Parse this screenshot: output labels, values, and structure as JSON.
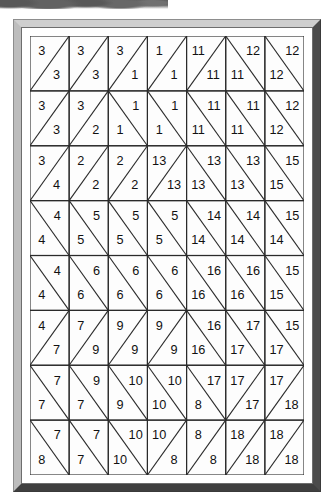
{
  "figure": {
    "kind": "triangulated-grid-label-diagram",
    "rows": 8,
    "cols": 7,
    "frame_color": "#d9d9d9",
    "line_color": "#2b2b2b",
    "label_color": "#111111",
    "background_color": "#ffffff",
    "artifact": {
      "name": "scan-smudge",
      "color": "#4f4f4f"
    }
  },
  "chart_data": {
    "type": "heatmap",
    "title": "",
    "xlabel": "",
    "ylabel": "",
    "rows": 8,
    "cols": 7,
    "note": "Each grid cell is split by a diagonal into two triangles; each triangle carries an integer region label.",
    "diagonal_legend": {
      "slash": "diagonal from bottom-left to top-right; upper triangle is upper-left, lower triangle is lower-right",
      "backslash": "diagonal from top-left to bottom-right; upper triangle is upper-right, lower triangle is lower-left"
    },
    "cells": [
      [
        {
          "diag": "slash",
          "upper": "3",
          "lower": "3"
        },
        {
          "diag": "slash",
          "upper": "3",
          "lower": "3"
        },
        {
          "diag": "slash",
          "upper": "3",
          "lower": "1"
        },
        {
          "diag": "slash",
          "upper": "1",
          "lower": "1"
        },
        {
          "diag": "slash",
          "upper": "11",
          "lower": "11"
        },
        {
          "diag": "backslash",
          "upper": "12",
          "lower": "11"
        },
        {
          "diag": "backslash",
          "upper": "12",
          "lower": "12"
        }
      ],
      [
        {
          "diag": "slash",
          "upper": "3",
          "lower": "3"
        },
        {
          "diag": "slash",
          "upper": "3",
          "lower": "2"
        },
        {
          "diag": "backslash",
          "upper": "1",
          "lower": "1"
        },
        {
          "diag": "backslash",
          "upper": "1",
          "lower": "1"
        },
        {
          "diag": "backslash",
          "upper": "11",
          "lower": "11"
        },
        {
          "diag": "backslash",
          "upper": "11",
          "lower": "11"
        },
        {
          "diag": "backslash",
          "upper": "12",
          "lower": "12"
        }
      ],
      [
        {
          "diag": "slash",
          "upper": "3",
          "lower": "4"
        },
        {
          "diag": "slash",
          "upper": "2",
          "lower": "2"
        },
        {
          "diag": "slash",
          "upper": "2",
          "lower": "2"
        },
        {
          "diag": "slash",
          "upper": "13",
          "lower": "13"
        },
        {
          "diag": "backslash",
          "upper": "13",
          "lower": "13"
        },
        {
          "diag": "backslash",
          "upper": "13",
          "lower": "13"
        },
        {
          "diag": "backslash",
          "upper": "15",
          "lower": "15"
        }
      ],
      [
        {
          "diag": "backslash",
          "upper": "4",
          "lower": "4"
        },
        {
          "diag": "backslash",
          "upper": "5",
          "lower": "5"
        },
        {
          "diag": "backslash",
          "upper": "5",
          "lower": "5"
        },
        {
          "diag": "backslash",
          "upper": "5",
          "lower": "5"
        },
        {
          "diag": "backslash",
          "upper": "14",
          "lower": "14"
        },
        {
          "diag": "backslash",
          "upper": "14",
          "lower": "14"
        },
        {
          "diag": "backslash",
          "upper": "15",
          "lower": "14"
        }
      ],
      [
        {
          "diag": "backslash",
          "upper": "4",
          "lower": "4"
        },
        {
          "diag": "backslash",
          "upper": "6",
          "lower": "6"
        },
        {
          "diag": "backslash",
          "upper": "6",
          "lower": "6"
        },
        {
          "diag": "backslash",
          "upper": "6",
          "lower": "6"
        },
        {
          "diag": "backslash",
          "upper": "16",
          "lower": "16"
        },
        {
          "diag": "backslash",
          "upper": "16",
          "lower": "16"
        },
        {
          "diag": "backslash",
          "upper": "15",
          "lower": "15"
        }
      ],
      [
        {
          "diag": "slash",
          "upper": "4",
          "lower": "7"
        },
        {
          "diag": "slash",
          "upper": "7",
          "lower": "9"
        },
        {
          "diag": "slash",
          "upper": "9",
          "lower": "9"
        },
        {
          "diag": "slash",
          "upper": "9",
          "lower": "9"
        },
        {
          "diag": "backslash",
          "upper": "16",
          "lower": "16"
        },
        {
          "diag": "backslash",
          "upper": "17",
          "lower": "17"
        },
        {
          "diag": "backslash",
          "upper": "15",
          "lower": "17"
        }
      ],
      [
        {
          "diag": "backslash",
          "upper": "7",
          "lower": "7"
        },
        {
          "diag": "backslash",
          "upper": "9",
          "lower": "7"
        },
        {
          "diag": "backslash",
          "upper": "10",
          "lower": "9"
        },
        {
          "diag": "backslash",
          "upper": "10",
          "lower": "10"
        },
        {
          "diag": "backslash",
          "upper": "17",
          "lower": "8"
        },
        {
          "diag": "slash",
          "upper": "17",
          "lower": "17"
        },
        {
          "diag": "slash",
          "upper": "17",
          "lower": "18"
        }
      ],
      [
        {
          "diag": "backslash",
          "upper": "7",
          "lower": "8"
        },
        {
          "diag": "backslash",
          "upper": "7",
          "lower": "7"
        },
        {
          "diag": "backslash",
          "upper": "10",
          "lower": "10"
        },
        {
          "diag": "slash",
          "upper": "10",
          "lower": "8"
        },
        {
          "diag": "slash",
          "upper": "8",
          "lower": "8"
        },
        {
          "diag": "slash",
          "upper": "18",
          "lower": "18"
        },
        {
          "diag": "slash",
          "upper": "18",
          "lower": "18"
        }
      ]
    ]
  }
}
